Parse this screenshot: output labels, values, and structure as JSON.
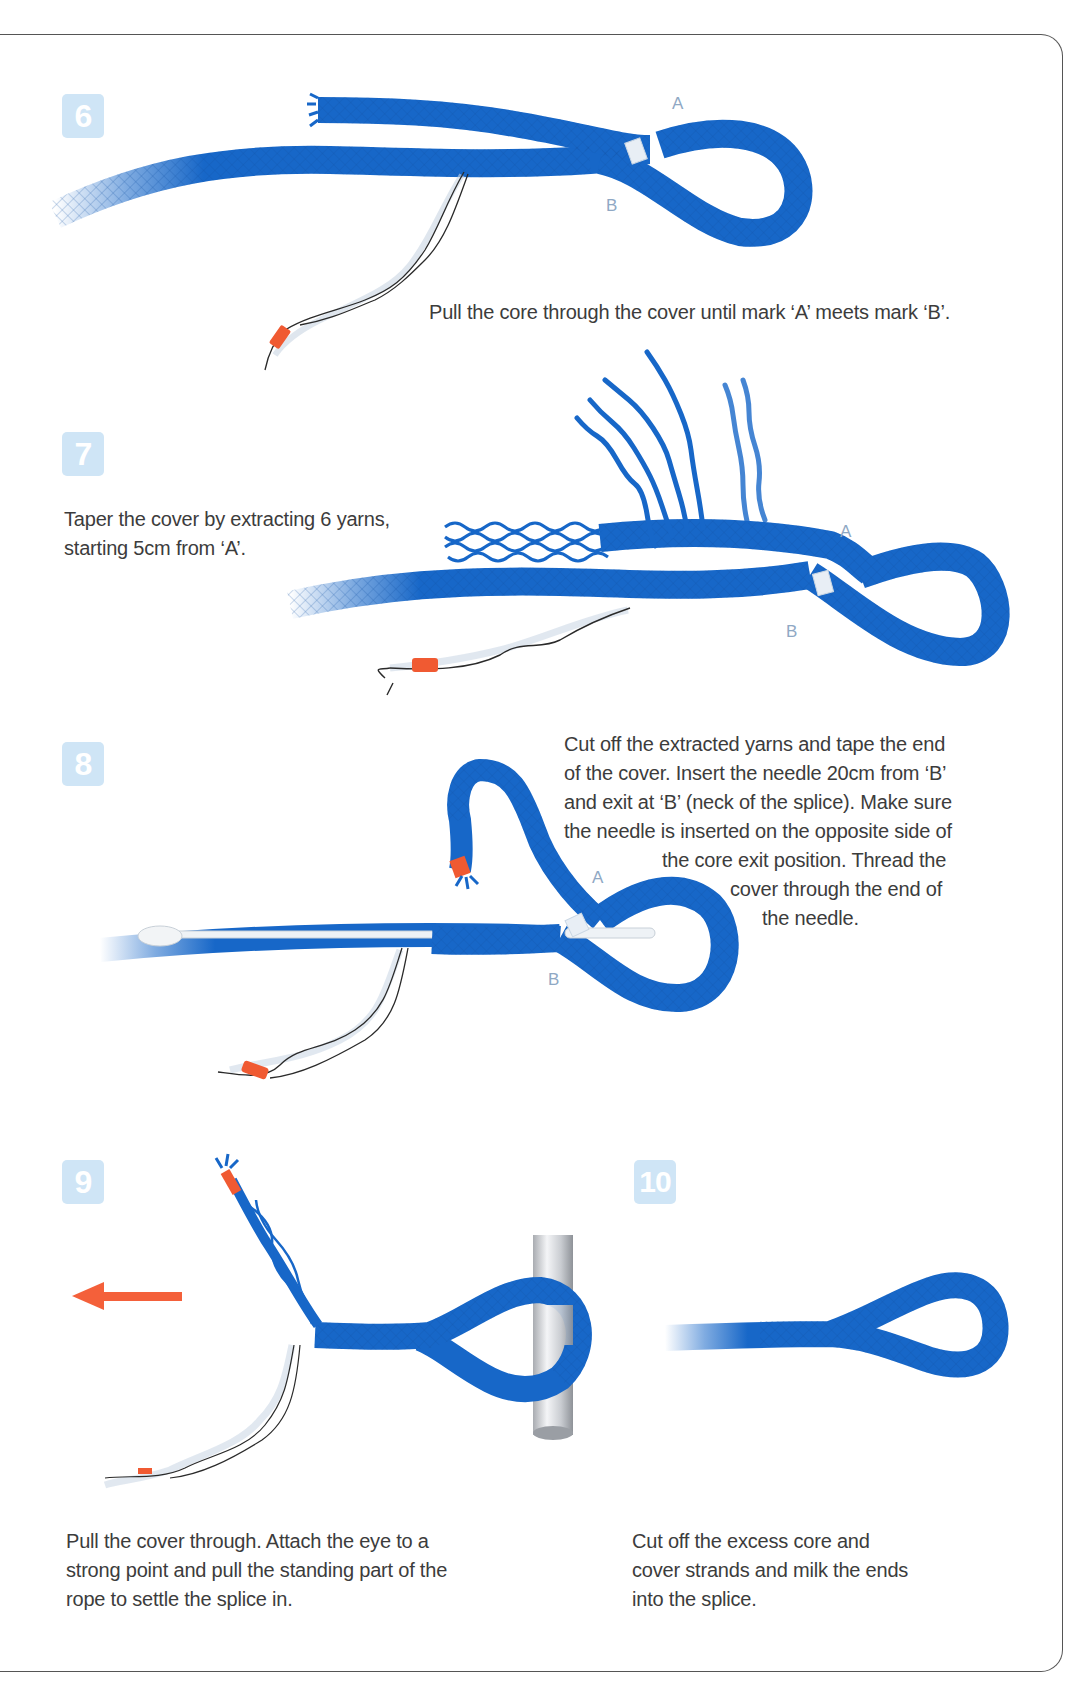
{
  "colors": {
    "rope_blue": "#1767c8",
    "rope_dark": "#0f4fa3",
    "badge_bg": "#cfe5f6",
    "tape_orange": "#f05a32",
    "arrow_orange": "#f4603a",
    "mark_label": "#8fa8c4",
    "border": "#555555"
  },
  "steps": [
    {
      "number": "6",
      "marks": {
        "a": "A",
        "b": "B"
      },
      "text_lines": [
        "Pull the core through the cover until mark ‘A’ meets mark ‘B’."
      ]
    },
    {
      "number": "7",
      "marks": {
        "a": "A",
        "b": "B"
      },
      "text_lines": [
        "Taper the cover by extracting 6 yarns,",
        "starting 5cm from ‘A’."
      ]
    },
    {
      "number": "8",
      "marks": {
        "a": "A",
        "b": "B"
      },
      "text_lines": [
        "Cut off the extracted yarns and tape the end",
        "of the cover. Insert the needle 20cm from ‘B’",
        "and exit at ‘B’ (neck of the splice). Make sure",
        "the needle is inserted on the opposite side of",
        "the core exit position. Thread the",
        "cover through the end of",
        "the needle."
      ]
    },
    {
      "number": "9",
      "icons": [
        "pull-arrow-left-icon",
        "pole-icon"
      ],
      "text_lines": [
        "Pull the cover through. Attach the eye to a",
        "strong point and pull the standing part of the",
        "rope to settle the splice in."
      ]
    },
    {
      "number": "10",
      "text_lines": [
        "Cut off the excess core and",
        "cover strands and milk the ends",
        "into the splice."
      ]
    }
  ]
}
